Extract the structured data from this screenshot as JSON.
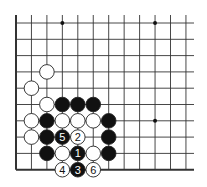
{
  "diagram": {
    "type": "go-board-fragment",
    "cols": 12,
    "rows": 10,
    "origin_x": 16,
    "origin_y": 23,
    "spacing_x": 15.45,
    "spacing_y": 16.3,
    "right_extent": 194,
    "edges": {
      "left": true,
      "bottom": true,
      "top": false,
      "right": false
    },
    "colors": {
      "line": "#333333",
      "black_stone": "#111111",
      "white_stone": "#ffffff",
      "stone_outline": "#222222"
    },
    "star_points": [
      {
        "col": 3,
        "row": 0
      },
      {
        "col": 9,
        "row": 0
      },
      {
        "col": 9,
        "row": 6
      }
    ],
    "stones": [
      {
        "col": 2,
        "row": 3,
        "color": "white",
        "label": ""
      },
      {
        "col": 1,
        "row": 4,
        "color": "white",
        "label": ""
      },
      {
        "col": 2,
        "row": 5,
        "color": "white",
        "label": ""
      },
      {
        "col": 3,
        "row": 5,
        "color": "black",
        "label": ""
      },
      {
        "col": 4,
        "row": 5,
        "color": "black",
        "label": ""
      },
      {
        "col": 5,
        "row": 5,
        "color": "black",
        "label": ""
      },
      {
        "col": 1,
        "row": 6,
        "color": "white",
        "label": ""
      },
      {
        "col": 2,
        "row": 6,
        "color": "black",
        "label": ""
      },
      {
        "col": 3,
        "row": 6,
        "color": "white",
        "label": ""
      },
      {
        "col": 4,
        "row": 6,
        "color": "white",
        "label": ""
      },
      {
        "col": 5,
        "row": 6,
        "color": "white",
        "label": ""
      },
      {
        "col": 6,
        "row": 6,
        "color": "black",
        "label": ""
      },
      {
        "col": 1,
        "row": 7,
        "color": "white",
        "label": ""
      },
      {
        "col": 2,
        "row": 7,
        "color": "black",
        "label": ""
      },
      {
        "col": 3,
        "row": 7,
        "color": "black",
        "label": "5"
      },
      {
        "col": 4,
        "row": 7,
        "color": "white",
        "label": "2"
      },
      {
        "col": 6,
        "row": 7,
        "color": "black",
        "label": ""
      },
      {
        "col": 2,
        "row": 8,
        "color": "black",
        "label": ""
      },
      {
        "col": 3,
        "row": 8,
        "color": "white",
        "label": ""
      },
      {
        "col": 4,
        "row": 8,
        "color": "black",
        "label": "1"
      },
      {
        "col": 5,
        "row": 8,
        "color": "white",
        "label": ""
      },
      {
        "col": 6,
        "row": 8,
        "color": "black",
        "label": ""
      },
      {
        "col": 3,
        "row": 9,
        "color": "white",
        "label": "4"
      },
      {
        "col": 4,
        "row": 9,
        "color": "black",
        "label": "3"
      },
      {
        "col": 5,
        "row": 9,
        "color": "white",
        "label": "6"
      }
    ]
  }
}
